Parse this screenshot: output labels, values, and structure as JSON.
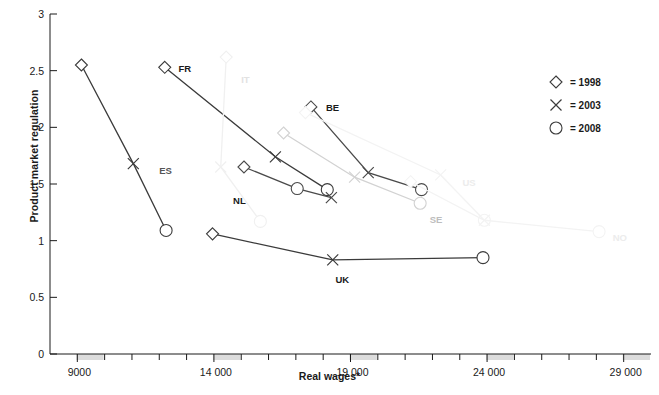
{
  "chart_data": {
    "type": "line",
    "title": "",
    "xlabel": "Real wages*",
    "ylabel": "Product market regulation",
    "xlim": [
      8000,
      30000
    ],
    "ylim": [
      0,
      3
    ],
    "xticks": [
      9000,
      14000,
      19000,
      24000,
      29000
    ],
    "xtick_labels": [
      "9000",
      "14 000",
      "19 000",
      "24 000",
      "29 000"
    ],
    "xminor_step": 1000,
    "yticks": [
      0,
      0.5,
      1,
      1.5,
      2,
      2.5,
      3
    ],
    "ytick_labels": [
      "0",
      "0.5",
      "1",
      "1.5",
      "2",
      "2.5",
      "3"
    ],
    "grid": false,
    "legend_position": "top-right",
    "legend": [
      {
        "marker": "diamond",
        "label": "= 1998"
      },
      {
        "marker": "cross",
        "label": "= 2003"
      },
      {
        "marker": "circle",
        "label": "= 2008"
      }
    ],
    "marker_years": [
      "1998",
      "2003",
      "2008"
    ],
    "series": [
      {
        "name": "ES",
        "label": "ES",
        "color": "#3b3b3b",
        "label_color": "#555555",
        "label_x": 12000,
        "label_y": 1.62,
        "points": [
          {
            "year": "1998",
            "marker": "diamond",
            "x": 9150,
            "y": 2.55
          },
          {
            "year": "2003",
            "marker": "cross",
            "x": 11050,
            "y": 1.68
          },
          {
            "year": "2008",
            "marker": "circle",
            "x": 12250,
            "y": 1.09
          }
        ]
      },
      {
        "name": "FR",
        "label": "FR",
        "color": "#3b3b3b",
        "label_color": "#1a1a1a",
        "label_x": 12700,
        "label_y": 2.52,
        "points": [
          {
            "year": "1998",
            "marker": "diamond",
            "x": 12200,
            "y": 2.53
          },
          {
            "year": "2003",
            "marker": "cross",
            "x": 16250,
            "y": 1.74
          },
          {
            "year": "2008",
            "marker": "circle",
            "x": 18150,
            "y": 1.45
          }
        ]
      },
      {
        "name": "NL",
        "label": "NL",
        "color": "#4a4a4a",
        "label_color": "#1a1a1a",
        "label_x": 14700,
        "label_y": 1.36,
        "points": [
          {
            "year": "1998",
            "marker": "diamond",
            "x": 15100,
            "y": 1.65
          },
          {
            "year": "2008",
            "marker": "circle",
            "x": 17050,
            "y": 1.46
          },
          {
            "year": "2003",
            "marker": "cross",
            "x": 18300,
            "y": 1.38
          }
        ]
      },
      {
        "name": "BE",
        "label": "BE",
        "color": "#4a4a4a",
        "label_color": "#1a1a1a",
        "label_x": 18100,
        "label_y": 2.18,
        "points": [
          {
            "year": "1998",
            "marker": "diamond",
            "x": 17550,
            "y": 2.18
          },
          {
            "year": "2003",
            "marker": "cross",
            "x": 19650,
            "y": 1.6
          },
          {
            "year": "2008",
            "marker": "circle",
            "x": 21600,
            "y": 1.45
          }
        ]
      },
      {
        "name": "SE",
        "label": "SE",
        "color": "#d2d2d2",
        "label_color": "#bdbdbd",
        "label_x": 21900,
        "label_y": 1.19,
        "points": [
          {
            "year": "1998",
            "marker": "diamond",
            "x": 16550,
            "y": 1.95
          },
          {
            "year": "2003",
            "marker": "cross",
            "x": 19150,
            "y": 1.56
          },
          {
            "year": "2008",
            "marker": "circle",
            "x": 21550,
            "y": 1.33
          }
        ]
      },
      {
        "name": "UK",
        "label": "UK",
        "color": "#3b3b3b",
        "label_color": "#1a1a1a",
        "label_x": 18450,
        "label_y": 0.66,
        "points": [
          {
            "year": "1998",
            "marker": "diamond",
            "x": 13950,
            "y": 1.06
          },
          {
            "year": "2003",
            "marker": "cross",
            "x": 18350,
            "y": 0.83
          },
          {
            "year": "2008",
            "marker": "circle",
            "x": 23850,
            "y": 0.85
          }
        ]
      },
      {
        "name": "IT",
        "label": "IT",
        "color": "#f0f0f0",
        "label_color": "#e2e2e2",
        "label_x": 15000,
        "label_y": 2.43,
        "points": [
          {
            "year": "1998",
            "marker": "diamond",
            "x": 14450,
            "y": 2.62
          },
          {
            "year": "2003",
            "marker": "cross",
            "x": 14250,
            "y": 1.65
          },
          {
            "year": "2008",
            "marker": "circle",
            "x": 15700,
            "y": 1.17
          }
        ]
      },
      {
        "name": "US",
        "label": "US",
        "color": "#f3f3f3",
        "label_color": "#ececec",
        "label_x": 23100,
        "label_y": 1.52,
        "points": [
          {
            "year": "1998",
            "marker": "diamond",
            "x": 17350,
            "y": 2.13
          },
          {
            "year": "2003",
            "marker": "cross",
            "x": 22300,
            "y": 1.58
          },
          {
            "year": "2008",
            "marker": "circle",
            "x": 23900,
            "y": 1.18
          }
        ]
      },
      {
        "name": "NO",
        "label": "NO",
        "color": "#f3f3f3",
        "label_color": "#ececec",
        "label_x": 28600,
        "label_y": 1.03,
        "points": [
          {
            "year": "1998",
            "marker": "diamond",
            "x": 21200,
            "y": 1.52
          },
          {
            "year": "2003",
            "marker": "cross",
            "x": 23900,
            "y": 1.18
          },
          {
            "year": "2008",
            "marker": "circle",
            "x": 28100,
            "y": 1.08
          }
        ]
      }
    ]
  }
}
